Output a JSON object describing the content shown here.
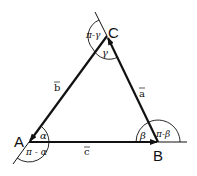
{
  "diagram": {
    "vertices": {
      "A": {
        "label": "A",
        "x": 29,
        "y": 142
      },
      "B": {
        "label": "B",
        "x": 158,
        "y": 142
      },
      "C": {
        "label": "C",
        "x": 107,
        "y": 36
      }
    },
    "vectors": {
      "a": {
        "label": "a",
        "from": "B",
        "to": "C"
      },
      "b": {
        "label": "b",
        "from": "C",
        "to": "A"
      },
      "c": {
        "label": "c",
        "from": "A",
        "to": "B"
      }
    },
    "angles": {
      "alpha": {
        "label": "α",
        "vertex": "A"
      },
      "beta": {
        "label": "β",
        "vertex": "B"
      },
      "gamma": {
        "label": "γ",
        "vertex": "C"
      },
      "ext_alpha": {
        "label": "π - α",
        "vertex": "A"
      },
      "ext_beta": {
        "label": "π-β",
        "vertex": "B"
      },
      "ext_gamma": {
        "label": "π-γ",
        "vertex": "C"
      }
    },
    "colors": {
      "stroke": "#111111",
      "background": "#ffffff"
    }
  }
}
